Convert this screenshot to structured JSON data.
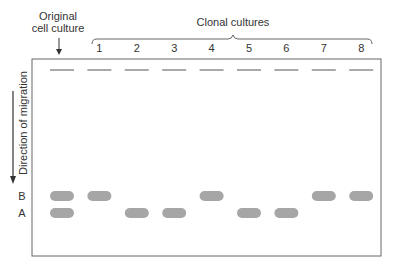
{
  "labels": {
    "original_line1": "Original",
    "original_line2": "cell culture",
    "clonal": "Clonal cultures",
    "direction": "Direction of migration"
  },
  "band_labels": {
    "B": "B",
    "A": "A"
  },
  "lanes": [
    {
      "label": "",
      "bands": [
        "B",
        "A"
      ],
      "kind": "original"
    },
    {
      "label": "1",
      "bands": [
        "B"
      ]
    },
    {
      "label": "2",
      "bands": [
        "A"
      ]
    },
    {
      "label": "3",
      "bands": [
        "A"
      ]
    },
    {
      "label": "4",
      "bands": [
        "B"
      ]
    },
    {
      "label": "5",
      "bands": [
        "A"
      ]
    },
    {
      "label": "6",
      "bands": [
        "A"
      ]
    },
    {
      "label": "7",
      "bands": [
        "B"
      ]
    },
    {
      "label": "8",
      "bands": [
        "B"
      ]
    }
  ],
  "colors": {
    "band": "#a6a6a6",
    "line": "#555555",
    "text": "#333333"
  }
}
